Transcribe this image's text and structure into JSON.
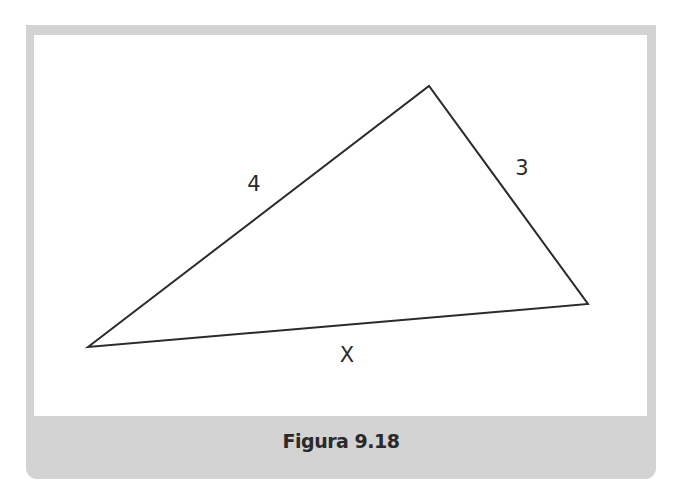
{
  "figure": {
    "caption": "Figura 9.18",
    "colors": {
      "frame": "#d3d3d3",
      "canvas": "#ffffff",
      "stroke": "#2b2b2b"
    },
    "triangle": {
      "vertices": {
        "left": [
          88,
          347
        ],
        "top": [
          429,
          86
        ],
        "right": [
          588,
          304
        ]
      },
      "sides": [
        {
          "name": "left-top",
          "label": "4",
          "label_pos": [
            254,
            184
          ]
        },
        {
          "name": "top-right",
          "label": "3",
          "label_pos": [
            522,
            168
          ]
        },
        {
          "name": "left-right",
          "label": "X",
          "label_pos": [
            347,
            355
          ]
        }
      ]
    }
  }
}
